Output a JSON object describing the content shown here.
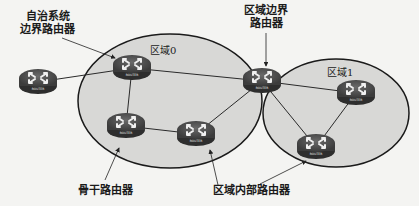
{
  "diagram": {
    "areas": [
      {
        "id": "area0",
        "label": "区域0"
      },
      {
        "id": "area1",
        "label": "区域1"
      }
    ],
    "router_label": "ROUTER",
    "routers": [
      {
        "id": "external",
        "role": "external"
      },
      {
        "id": "asbr",
        "role": "asbr"
      },
      {
        "id": "backbone",
        "role": "backbone"
      },
      {
        "id": "internal0",
        "role": "internal"
      },
      {
        "id": "abr",
        "role": "abr"
      },
      {
        "id": "r1a",
        "role": "internal"
      },
      {
        "id": "r1b",
        "role": "internal"
      }
    ],
    "links": [
      [
        "external",
        "asbr"
      ],
      [
        "asbr",
        "abr"
      ],
      [
        "asbr",
        "backbone"
      ],
      [
        "backbone",
        "internal0"
      ],
      [
        "internal0",
        "abr"
      ],
      [
        "abr",
        "r1a"
      ],
      [
        "abr",
        "r1b"
      ],
      [
        "r1a",
        "r1b"
      ]
    ],
    "callouts": {
      "asbr_line1": "自治系统",
      "asbr_line2": "边界路由器",
      "abr_line1": "区域边界",
      "abr_line2": "路由器",
      "backbone": "骨干路由器",
      "internal": "区域内部路由器"
    },
    "colors": {
      "area_fill": "#d6d6d4",
      "router_body": "#4a4a4a",
      "line": "#2a2a2a"
    }
  }
}
